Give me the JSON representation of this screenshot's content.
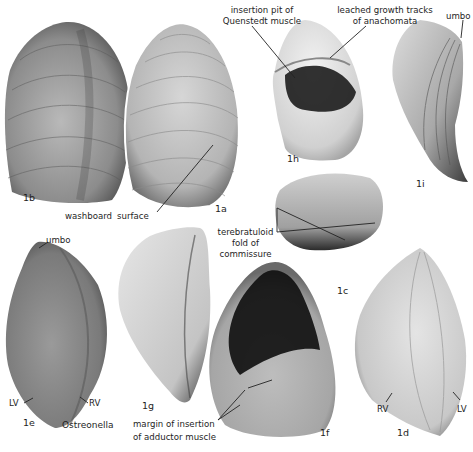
{
  "figure": {
    "genus": "Ostreonella",
    "specimens": [
      {
        "id": "1a",
        "label": "1a"
      },
      {
        "id": "1b",
        "label": "1b"
      },
      {
        "id": "1c",
        "label": "1c"
      },
      {
        "id": "1d",
        "label": "1d"
      },
      {
        "id": "1e",
        "label": "1e"
      },
      {
        "id": "1f",
        "label": "1f"
      },
      {
        "id": "1g",
        "label": "1g"
      },
      {
        "id": "1h",
        "label": "1h"
      },
      {
        "id": "1i",
        "label": "1i"
      }
    ],
    "annotations": {
      "insertion_pit_line1": "insertion pit of",
      "insertion_pit_line2": "Quenstedt muscle",
      "leached_line1": "leached growth tracks",
      "leached_line2": "of anachomata",
      "umbo_1i": "umbo",
      "washboard_a": "washboard",
      "washboard_b": "surface",
      "terebratuloid_line1": "terebratuloid",
      "terebratuloid_line2": "fold of",
      "terebratuloid_line3": "commissure",
      "umbo_1e": "umbo",
      "lv_1e": "LV",
      "rv_1e": "RV",
      "margin_line1": "margin of insertion",
      "margin_line2": "of adductor muscle",
      "rv_1d": "RV",
      "lv_1d": "LV"
    }
  }
}
